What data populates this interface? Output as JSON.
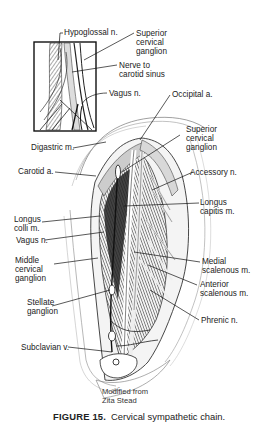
{
  "figure": {
    "number_label": "FIGURE 15.",
    "caption": "Cervical sympathetic chain.",
    "credit": "Modified from\nZita Stead",
    "artist_initials": "ZRC",
    "colors": {
      "ink": "#1a1a1a",
      "background": "#ffffff",
      "shade": "#555555"
    }
  },
  "inset": {
    "labels": [
      {
        "text": "Hypoglossal n."
      },
      {
        "text": "Superior\ncervical\nganglion"
      },
      {
        "text": "Nerve to\ncarotid sinus"
      },
      {
        "text": "Vagus n."
      }
    ]
  },
  "main": {
    "labels": [
      {
        "text": "Occipital a."
      },
      {
        "text": "Superior\ncervical\nganglion"
      },
      {
        "text": "Digastric m."
      },
      {
        "text": "Carotid a."
      },
      {
        "text": "Accessory n."
      },
      {
        "text": "Longus\ncapitis m."
      },
      {
        "text": "Longus\ncolli m."
      },
      {
        "text": "Vagus n."
      },
      {
        "text": "Middle\ncervical\nganglion"
      },
      {
        "text": "Medial\nscalenous m."
      },
      {
        "text": "Anterior\nscalenous m."
      },
      {
        "text": "Stellate\nganglion"
      },
      {
        "text": "Phrenic n."
      },
      {
        "text": "Subclavian v."
      }
    ]
  }
}
